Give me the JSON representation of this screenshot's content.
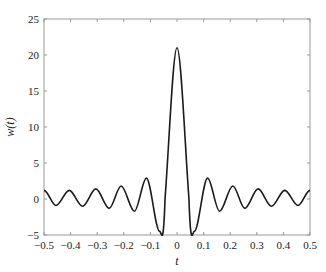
{
  "chart_data": {
    "type": "line",
    "title": "",
    "xlabel": "t",
    "ylabel": "w(t)",
    "xlim": [
      -0.5,
      0.5
    ],
    "ylim": [
      -5,
      25
    ],
    "grid": false,
    "legend": null,
    "x_ticks": [
      -0.5,
      -0.4,
      -0.3,
      -0.2,
      -0.1,
      0,
      0.1,
      0.2,
      0.3,
      0.4,
      0.5
    ],
    "x_tick_labels": [
      "−0.5",
      "−0.4",
      "−0.3",
      "−0.2",
      "−0.1",
      "0",
      "0.1",
      "0.2",
      "0.3",
      "0.4",
      "0.5"
    ],
    "y_ticks": [
      -5,
      0,
      5,
      10,
      15,
      20,
      25
    ],
    "y_tick_labels": [
      "−5",
      "0",
      "5",
      "10",
      "15",
      "20",
      "25"
    ],
    "series": [
      {
        "name": "w(t)",
        "color": "#1a1a1a",
        "x": [
          -0.5,
          -0.455,
          -0.405,
          -0.355,
          -0.305,
          -0.255,
          -0.21,
          -0.16,
          -0.115,
          -0.065,
          -0.045,
          0,
          0.045,
          0.065,
          0.115,
          0.16,
          0.21,
          0.255,
          0.305,
          0.355,
          0.405,
          0.455,
          0.5
        ],
        "y": [
          1.2,
          -0.9,
          1.2,
          -1.0,
          1.4,
          -1.3,
          1.8,
          -1.7,
          2.9,
          -4.5,
          0,
          21,
          0,
          -4.5,
          2.9,
          -1.7,
          1.8,
          -1.3,
          1.4,
          -1.0,
          1.2,
          -0.9,
          1.2
        ]
      }
    ]
  }
}
